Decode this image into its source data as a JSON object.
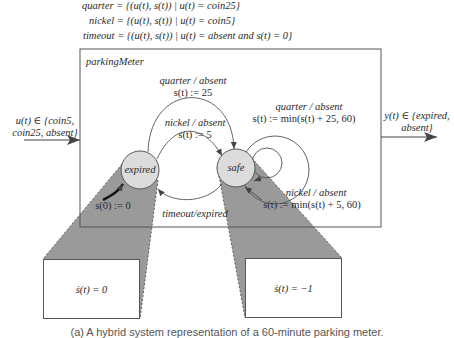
{
  "definitions": [
    {
      "name": "quarter",
      "expr": " = {(u(t), s(t)) | u(t) = coin25}"
    },
    {
      "name": "nickel",
      "expr": " = {(u(t), s(t)) | u(t) = coin5}"
    },
    {
      "name": "timeout",
      "expr": " = {(u(t), s(t)) | u(t) = absent and s(t) = 0}"
    }
  ],
  "machine": {
    "title": "parkingMeter",
    "input": {
      "line1": "u(t) ∈ {coin5,",
      "line2": "coin25, absent}"
    },
    "output": {
      "line1": "y(t) ∈ {expired,",
      "line2": "absent}"
    },
    "states": [
      {
        "id": "expired",
        "label": "expired"
      },
      {
        "id": "safe",
        "label": "safe"
      }
    ],
    "initial": {
      "label": "s(0) := 0"
    },
    "transitions": [
      {
        "from": "expired",
        "to": "safe",
        "guard": "quarter / absent",
        "action": "s(t) := 25"
      },
      {
        "from": "expired",
        "to": "safe",
        "guard": "nickel / absent",
        "action": "s(t) := 5"
      },
      {
        "from": "safe",
        "to": "safe",
        "guard": "quarter / absent",
        "action": "s(t) := min(s(t) + 25, 60)"
      },
      {
        "from": "safe",
        "to": "safe",
        "guard": "nickel / absent",
        "action": "s(t) := min(s(t) + 5, 60)"
      },
      {
        "from": "safe",
        "to": "expired",
        "guard": "timeout/expired",
        "action": ""
      }
    ]
  },
  "refinements": [
    {
      "state": "expired",
      "equation": "ṡ(t) = 0"
    },
    {
      "state": "safe",
      "equation": "ṡ(t) = −1"
    }
  ],
  "caption": "(a) A hybrid system representation of a 60-minute parking meter."
}
